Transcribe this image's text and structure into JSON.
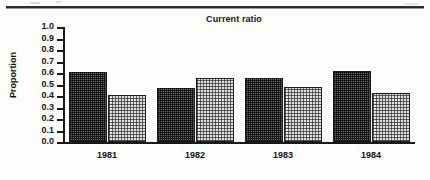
{
  "chart_data": {
    "type": "bar",
    "title": "Current ratio",
    "xlabel": "",
    "ylabel": "Proportion",
    "categories": [
      "1981",
      "1982",
      "1983",
      "1984"
    ],
    "ylim": [
      0.0,
      1.0
    ],
    "ytick_labels": [
      "1.0",
      "0.9",
      "0.8",
      "0.7",
      "0.6",
      "0.5",
      "0.4",
      "0.3",
      "0.2",
      "0.1",
      "0.0"
    ],
    "ytick_values": [
      1.0,
      0.9,
      0.8,
      0.7,
      0.6,
      0.5,
      0.4,
      0.3,
      0.2,
      0.1,
      0.0
    ],
    "grid": false,
    "legend_position": "none",
    "series": [
      {
        "name": "series-dark",
        "fill": "dark-dither",
        "color": "#4a4a4a",
        "values": [
          0.61,
          0.47,
          0.56,
          0.62
        ]
      },
      {
        "name": "series-light",
        "fill": "light-dither",
        "color": "#d6d6d6",
        "values": [
          0.41,
          0.56,
          0.48,
          0.43
        ]
      }
    ]
  },
  "colors": {
    "axis": "#1a1a1a",
    "text": "#141414",
    "bar_dark": "#4a4a4a",
    "bar_light": "#d6d6d6",
    "page": "#fdfdfc",
    "rule": "#2b2b2b"
  }
}
